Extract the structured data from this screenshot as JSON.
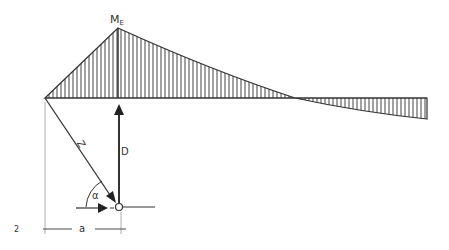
{
  "figure_number": "2",
  "labels": {
    "moment_peak": "M",
    "moment_peak_sub": "E",
    "tension_member": "Z",
    "compression_member": "D",
    "angle": "α",
    "dimension": "a"
  },
  "colors": {
    "line": "#333333",
    "hatch": "#444444",
    "background": "#ffffff"
  },
  "geometry": {
    "baseline_y": 98,
    "left_x": 45,
    "peak": [
      118,
      28
    ],
    "zero_crossing_x": 295,
    "right_end": {
      "x": 427,
      "y_bottom": 119
    },
    "joint": [
      119,
      207
    ],
    "dimension_line_y": 229
  }
}
